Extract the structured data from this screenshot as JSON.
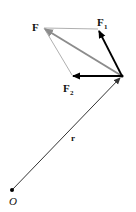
{
  "diagram": {
    "labels": {
      "F": "F",
      "F1_main": "F",
      "F1_sub": "1",
      "F2_main": "F",
      "F2_sub": "2",
      "r": "r",
      "O": "O"
    },
    "colors": {
      "component_vectors": "#000000",
      "resultant_vector": "#8c8c8c",
      "construction_lines": "#9a9a9a",
      "position_vector": "#333333"
    }
  }
}
